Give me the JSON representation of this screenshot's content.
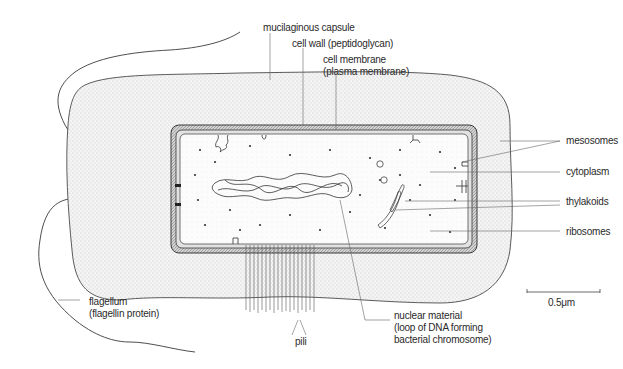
{
  "diagram": {
    "labels": {
      "capsule": "mucilaginous capsule",
      "cell_wall": "cell wall (peptidoglycan)",
      "cell_membrane_line1": "cell membrane",
      "cell_membrane_line2": "(plasma membrane)",
      "mesosomes": "mesosomes",
      "cytoplasm": "cytoplasm",
      "thylakoids": "thylakoids",
      "ribosomes": "ribosomes",
      "flagellum_line1": "flagellum",
      "flagellum_line2": "(flagellin protein)",
      "pili": "pili",
      "nuclear_line1": "nuclear material",
      "nuclear_line2": "(loop of DNA forming",
      "nuclear_line3": "bacterial chromosome)",
      "scale": "0.5μm"
    },
    "colors": {
      "line": "#3a3a3a",
      "capsule_fill": "#ececec",
      "wall_fill": "#bdbdbd",
      "cytoplasm_fill": "#fafafa",
      "text": "#2a2a2a"
    }
  }
}
